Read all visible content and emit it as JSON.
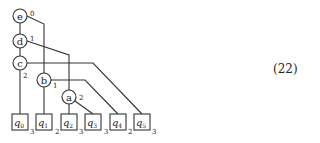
{
  "equation_number": "(22)",
  "nodes": {
    "e": {
      "label": "e",
      "index": "0"
    },
    "d": {
      "label": "d",
      "index": "1"
    },
    "c": {
      "label": "c",
      "index": "2"
    },
    "b": {
      "label": "b",
      "index": "1"
    },
    "a": {
      "label": "a",
      "index": "2"
    }
  },
  "leaves": [
    {
      "label": "q",
      "sub": "0",
      "index": "3"
    },
    {
      "label": "q",
      "sub": "1",
      "index": "2"
    },
    {
      "label": "q",
      "sub": "2",
      "index": "3"
    },
    {
      "label": "q",
      "sub": "3",
      "index": "3"
    },
    {
      "label": "q",
      "sub": "4",
      "index": "2"
    },
    {
      "label": "q",
      "sub": "5",
      "index": "3"
    }
  ],
  "colors": {
    "stroke": "#333333",
    "text": "#222222"
  }
}
